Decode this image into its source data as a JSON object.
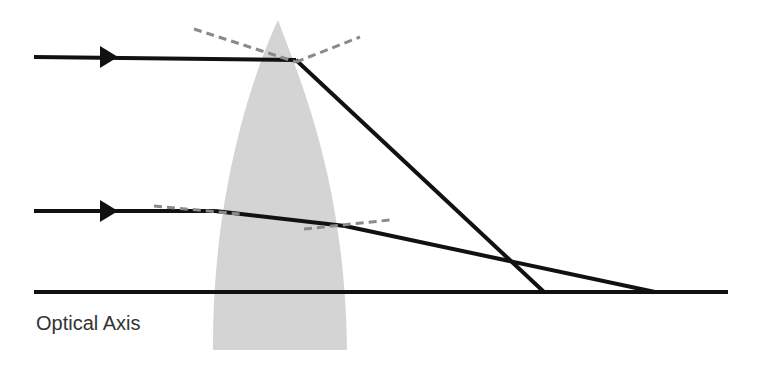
{
  "diagram": {
    "axis_label": "Optical Axis",
    "colors": {
      "ray": "#111111",
      "lens": "#d4d4d4",
      "normal": "#8a8a8a",
      "background": "#ffffff"
    },
    "elements": [
      "incoming-ray-top",
      "incoming-ray-bottom",
      "lens",
      "normal-lines",
      "refracted-rays",
      "optical-axis"
    ]
  }
}
